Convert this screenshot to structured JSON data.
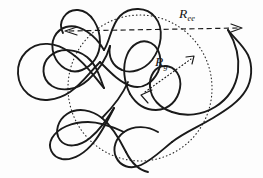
{
  "figure": {
    "type": "polymer-random-coil-diagram",
    "background_color": "#fdfdfd",
    "stroke_color": "#1a1a1a",
    "width": 263,
    "height": 178,
    "labels": {
      "end_to_end": {
        "symbol": "R",
        "subscript": "ee",
        "meaning": "end-to-end distance",
        "x": 179,
        "y": 7
      },
      "radius_of_gyration": {
        "symbol": "R",
        "subscript": "g",
        "meaning": "radius of gyration",
        "x": 155,
        "y": 55
      }
    },
    "measures": [
      {
        "name": "end-to-end-vector",
        "style": "dashed",
        "arrowheads": "both",
        "from_x": 66,
        "from_y": 31,
        "to_x": 241,
        "to_y": 28
      },
      {
        "name": "radius-of-gyration-vector",
        "style": "dotted",
        "arrowheads": "both",
        "from_x": 142,
        "from_y": 94,
        "to_x": 193,
        "to_y": 57
      }
    ],
    "envelope": {
      "name": "gyration-envelope",
      "shape": "ellipse",
      "style": "dotted",
      "center_x": 140,
      "center_y": 88,
      "radius_x": 72,
      "radius_y": 73,
      "rotation_deg": -8
    },
    "chain": {
      "name": "polymer-chain",
      "style": "solid",
      "description": "self-avoiding random coil with multiple loops and crossings"
    }
  }
}
